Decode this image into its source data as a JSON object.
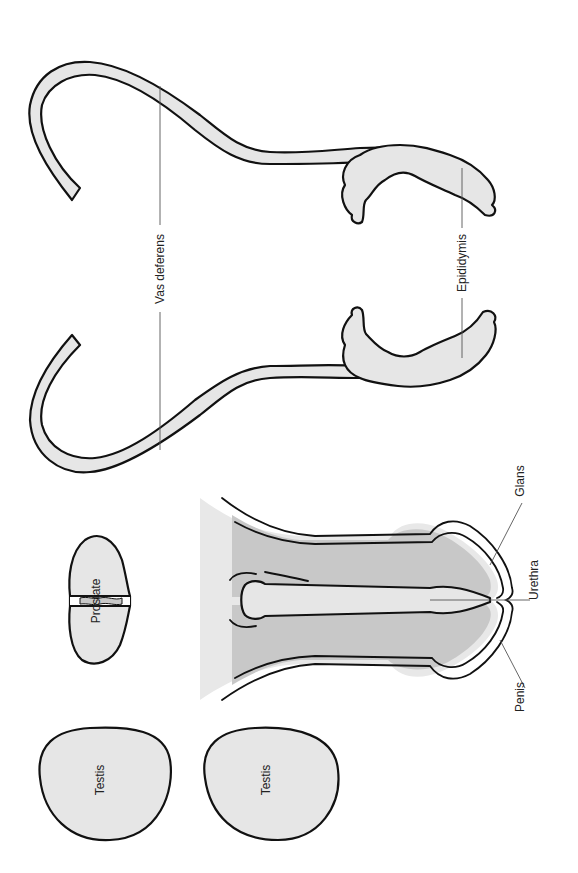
{
  "diagram": {
    "orientation": "rotated 90 degrees clockwise",
    "colors": {
      "organ_fill": "#e6e6e6",
      "shaft_fill": "#c8c8c8",
      "outline": "#111111",
      "leader": "#555555",
      "background": "#ffffff"
    },
    "labels": {
      "vas_deferens": "Vas deferens",
      "epididymis": "Epididymis",
      "prostate": "Prostate",
      "glans": "Glans",
      "urethra": "Urethra",
      "penis": "Penis",
      "testis_left": "Testis",
      "testis_right": "Testis"
    },
    "parts": [
      {
        "id": "vas-deferens-epididymis-top",
        "label": "Vas deferens / Epididymis"
      },
      {
        "id": "vas-deferens-epididymis-bottom",
        "label": "Vas deferens / Epididymis"
      },
      {
        "id": "prostate",
        "label": "Prostate"
      },
      {
        "id": "penis",
        "label": "Penis",
        "subparts": [
          "Glans",
          "Urethra"
        ]
      },
      {
        "id": "testis-1",
        "label": "Testis"
      },
      {
        "id": "testis-2",
        "label": "Testis"
      }
    ]
  }
}
